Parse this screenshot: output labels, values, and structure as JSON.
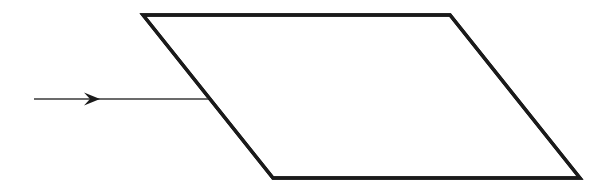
{
  "figure": {
    "type": "geometry-diagram",
    "background_color": "#ffffff",
    "canvas": {
      "width": 589,
      "height": 193
    },
    "shapes": {
      "parallelogram": {
        "name": "parallelogram",
        "stroke_color": "#1a1a1a",
        "fill_color": "#ffffff",
        "stroke_width": 3.4,
        "vertices": [
          {
            "label": "top-left",
            "x": 143,
            "y": 15
          },
          {
            "label": "top-right",
            "x": 450,
            "y": 15
          },
          {
            "label": "bottom-right",
            "x": 580,
            "y": 178
          },
          {
            "label": "bottom-left",
            "x": 273,
            "y": 178
          }
        ],
        "points_string": "143,15 450,15 580,178 273,178"
      },
      "arrow": {
        "name": "incident-arrow",
        "stroke_color": "#3a3a3a",
        "stroke_width": 1.6,
        "start": {
          "x": 34,
          "y": 99
        },
        "end": {
          "x": 208,
          "y": 99
        },
        "direction": "right",
        "head": {
          "name": "arrowhead",
          "tip_x": 100,
          "tip_y": 99,
          "back_x": 84,
          "half_height": 6.5,
          "notch_x": 90,
          "fill_color": "#1a1a1a",
          "points_string": "100,99 84,92.5 90,99 84,105.5"
        }
      }
    }
  }
}
